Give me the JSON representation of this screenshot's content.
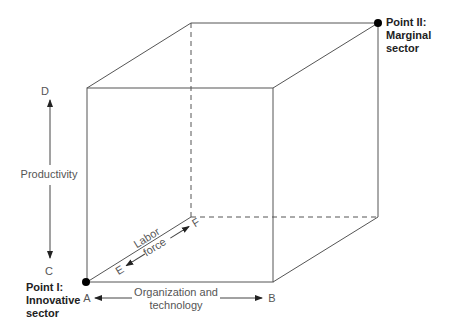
{
  "diagram": {
    "type": "3d-cube-axes",
    "points": {
      "point_1": {
        "title": "Point I:",
        "line2": "Innovative",
        "line3": "sector"
      },
      "point_2": {
        "title": "Point II:",
        "line2": "Marginal",
        "line3": "sector"
      }
    },
    "axes": {
      "vertical": {
        "label": "Productivity",
        "top": "D",
        "bottom": "C"
      },
      "horizontal": {
        "label_line1": "Organization and",
        "label_line2": "technology",
        "left": "A",
        "right": "B"
      },
      "depth": {
        "label_line1": "Labor",
        "label_line2": "force",
        "near": "E",
        "far": "F"
      }
    },
    "colors": {
      "line": "#555555",
      "dot": "#000000",
      "text": "#555555"
    }
  }
}
